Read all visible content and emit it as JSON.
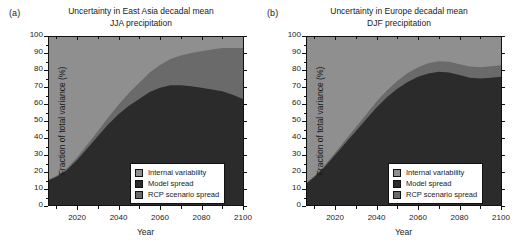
{
  "figure": {
    "width": 517,
    "height": 251,
    "background": "#ffffff"
  },
  "colors": {
    "internal_variability": "#8f8f8f",
    "model_spread": "#2b2b2b",
    "rcp_scenario_spread": "#6a6a6a",
    "axis": "#111111",
    "legend_background": "#ffffff"
  },
  "axis_titles": {
    "y": "Fraction of total variance (%)",
    "x": "Year"
  },
  "legend": {
    "items": [
      {
        "label": "Internal variability",
        "color": "#8f8f8f",
        "key": "internal_variability"
      },
      {
        "label": "Model spread",
        "color": "#2b2b2b",
        "key": "model_spread"
      },
      {
        "label": "RCP scenario spread",
        "color": "#6a6a6a",
        "key": "rcp_scenario_spread"
      }
    ]
  },
  "panels": [
    {
      "letter": "(a)",
      "title_line1": "Uncertainty in East Asia decadal mean",
      "title_line2": "JJA precipitation"
    },
    {
      "letter": "(b)",
      "title_line1": "Uncertainty in Europe decadal mean",
      "title_line2": "DJF precipitation"
    }
  ],
  "chart_data": [
    {
      "type": "area",
      "panel": "(a)",
      "title": "Uncertainty in East Asia decadal mean JJA precipitation",
      "xlabel": "Year",
      "ylabel": "Fraction of total variance (%)",
      "xlim": [
        2006,
        2100
      ],
      "ylim": [
        0,
        100
      ],
      "xticks": [
        2020,
        2040,
        2060,
        2080,
        2100
      ],
      "xticklabels": [
        "2020",
        "2040",
        "2060",
        "2080",
        "2100"
      ],
      "xminorticks": [
        2010,
        2030,
        2050,
        2070,
        2090
      ],
      "yticks": [
        0,
        10,
        20,
        30,
        40,
        50,
        60,
        70,
        80,
        90,
        100
      ],
      "yticklabels": [
        "0",
        "10",
        "20",
        "30",
        "40",
        "50",
        "60",
        "70",
        "80",
        "90",
        "100"
      ],
      "grid": false,
      "legend_position": "lower right",
      "stacked": true,
      "x": [
        2006,
        2010,
        2015,
        2020,
        2025,
        2030,
        2035,
        2040,
        2045,
        2050,
        2055,
        2060,
        2065,
        2070,
        2075,
        2080,
        2085,
        2090,
        2095,
        2100
      ],
      "series": [
        {
          "name": "Model spread",
          "color": "#2b2b2b",
          "values": [
            15,
            17,
            21,
            27,
            34,
            41,
            48,
            54,
            59,
            63,
            67,
            69.5,
            71,
            71,
            70.5,
            69.5,
            68.5,
            67.5,
            65.5,
            63
          ]
        },
        {
          "name": "RCP scenario spread",
          "color": "#6a6a6a",
          "values": [
            0.5,
            0.7,
            1.0,
            1.5,
            2.2,
            3.0,
            4.0,
            5.5,
            7.5,
            9.5,
            11.5,
            13.5,
            15.5,
            17.5,
            19.5,
            21.5,
            23.5,
            25.5,
            27.5,
            30
          ]
        },
        {
          "name": "Internal variability",
          "color": "#8f8f8f",
          "values": [
            84.5,
            82.3,
            78,
            71.5,
            63.8,
            56,
            48,
            40.5,
            33.5,
            27.5,
            21.5,
            17,
            13.5,
            11.5,
            10,
            9,
            8,
            7,
            7,
            7
          ]
        }
      ],
      "boundaries": {
        "model_spread_top": [
          15,
          17,
          21,
          27,
          34,
          41,
          48,
          54,
          59,
          63,
          67,
          69.5,
          71,
          71,
          70.5,
          69.5,
          68.5,
          67.5,
          65.5,
          63
        ],
        "rcp_top": [
          15.5,
          17.7,
          22,
          28.5,
          36.2,
          44,
          52,
          59.5,
          66.5,
          72.5,
          78.5,
          83,
          86.5,
          88.5,
          90,
          91,
          92,
          93,
          93,
          93
        ]
      }
    },
    {
      "type": "area",
      "panel": "(b)",
      "title": "Uncertainty in Europe decadal mean DJF precipitation",
      "xlabel": "Year",
      "ylabel": "Fraction of total variance (%)",
      "xlim": [
        2006,
        2100
      ],
      "ylim": [
        0,
        100
      ],
      "xticks": [
        2020,
        2040,
        2060,
        2080,
        2100
      ],
      "xticklabels": [
        "2020",
        "2040",
        "2060",
        "2080",
        "2100"
      ],
      "xminorticks": [
        2010,
        2030,
        2050,
        2070,
        2090
      ],
      "yticks": [
        0,
        10,
        20,
        30,
        40,
        50,
        60,
        70,
        80,
        90,
        100
      ],
      "yticklabels": [
        "0",
        "10",
        "20",
        "30",
        "40",
        "50",
        "60",
        "70",
        "80",
        "90",
        "100"
      ],
      "grid": false,
      "legend_position": "lower right",
      "stacked": true,
      "x": [
        2006,
        2010,
        2015,
        2020,
        2025,
        2030,
        2035,
        2040,
        2045,
        2050,
        2055,
        2060,
        2065,
        2070,
        2075,
        2080,
        2085,
        2090,
        2095,
        2100
      ],
      "series": [
        {
          "name": "Model spread",
          "color": "#2b2b2b",
          "values": [
            13,
            17,
            23,
            30,
            37,
            44,
            51,
            58,
            64,
            69,
            73,
            76,
            78,
            79,
            78.5,
            77,
            75.5,
            75,
            75.5,
            76
          ]
        },
        {
          "name": "RCP scenario spread",
          "color": "#6a6a6a",
          "values": [
            0.5,
            0.7,
            1.0,
            1.3,
            1.8,
            2.3,
            2.8,
            3.4,
            4.0,
            4.6,
            5.2,
            5.6,
            6.0,
            6.2,
            6.3,
            6.4,
            6.5,
            6.6,
            6.7,
            6.8
          ]
        },
        {
          "name": "Internal variability",
          "color": "#8f8f8f",
          "values": [
            86.5,
            82.3,
            76,
            68.7,
            61.2,
            53.7,
            46.2,
            38.6,
            32,
            26.4,
            21.8,
            18.4,
            16,
            14.8,
            15.2,
            16.6,
            18,
            18.4,
            17.8,
            17.2
          ]
        }
      ],
      "boundaries": {
        "model_spread_top": [
          13,
          17,
          23,
          30,
          37,
          44,
          51,
          58,
          64,
          69,
          73,
          76,
          78,
          79,
          78.5,
          77,
          75.5,
          75,
          75.5,
          76
        ],
        "rcp_top": [
          13.5,
          17.7,
          24,
          31.3,
          38.8,
          46.3,
          53.8,
          61.4,
          68,
          73.6,
          78.2,
          81.6,
          84,
          85.2,
          84.8,
          83.4,
          82,
          81.6,
          82.2,
          82.8
        ]
      }
    }
  ]
}
